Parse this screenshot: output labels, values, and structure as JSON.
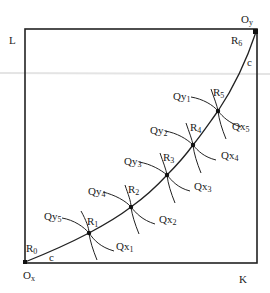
{
  "diagram": {
    "type": "edgeworth-box-contract-curve",
    "colors": {
      "line": "#222222",
      "background": "#ffffff"
    },
    "box": {
      "left": 25,
      "top": 29,
      "right": 257,
      "bottom": 263
    },
    "corner_labels": {
      "top_left": "L",
      "bottom_right": "K",
      "origin_x": "O",
      "origin_x_sub": "x",
      "origin_y": "O",
      "origin_y_sub": "y"
    },
    "curve_label": "c",
    "points": [
      {
        "id": "R0",
        "base": "R",
        "sub": "0",
        "x": 25,
        "y": 262
      },
      {
        "id": "R1",
        "base": "R",
        "sub": "1",
        "x": 89,
        "y": 233
      },
      {
        "id": "R2",
        "base": "R",
        "sub": "2",
        "x": 131,
        "y": 207
      },
      {
        "id": "R3",
        "base": "R",
        "sub": "3",
        "x": 167,
        "y": 175
      },
      {
        "id": "R4",
        "base": "R",
        "sub": "4",
        "x": 193,
        "y": 145
      },
      {
        "id": "R5",
        "base": "R",
        "sub": "5",
        "x": 218,
        "y": 111
      },
      {
        "id": "R6",
        "base": "R",
        "sub": "6",
        "x": 256,
        "y": 32
      }
    ],
    "isoquants_x": [
      {
        "base": "Qx",
        "sub": "1"
      },
      {
        "base": "Qx",
        "sub": "2"
      },
      {
        "base": "Qx",
        "sub": "3"
      },
      {
        "base": "Qx",
        "sub": "4"
      },
      {
        "base": "Qx",
        "sub": "5"
      }
    ],
    "isoquants_y": [
      {
        "base": "Qy",
        "sub": "5"
      },
      {
        "base": "Qy",
        "sub": "4"
      },
      {
        "base": "Qy",
        "sub": "3"
      },
      {
        "base": "Qy",
        "sub": "2"
      },
      {
        "base": "Qy",
        "sub": "1"
      }
    ]
  }
}
